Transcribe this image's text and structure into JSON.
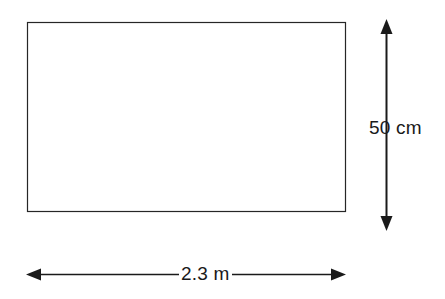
{
  "figure": {
    "type": "geometry-diagram",
    "shape": "rectangle",
    "background_color": "#ffffff",
    "stroke_color": "#262626",
    "text_color": "#1a1a1a",
    "rectangle": {
      "name": "rectangle-outline",
      "x": 27,
      "y": 22,
      "width": 319,
      "height": 190,
      "fill": "#ffffff",
      "stroke_width": 1.2
    },
    "dimensions": [
      {
        "id": "height",
        "label": "50 cm",
        "value": 50,
        "unit": "cm",
        "orientation": "vertical",
        "arrow_style": "double-headed",
        "axis_x": 386,
        "from_y": 20,
        "to_y": 230,
        "label_x": 369,
        "label_y": 118
      },
      {
        "id": "width",
        "label": "2.3 m",
        "value": 2.3,
        "unit": "m",
        "orientation": "horizontal",
        "arrow_style": "double-headed",
        "axis_y": 274,
        "from_x": 27,
        "to_x": 345,
        "label_x": 179,
        "label_y": 264
      }
    ]
  }
}
